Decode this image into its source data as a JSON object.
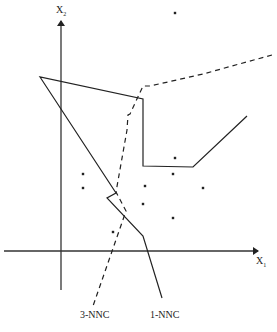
{
  "diagram": {
    "type": "nearest-neighbor decision boundaries",
    "axes": {
      "x": {
        "label": "X",
        "subscript": "1"
      },
      "y": {
        "label": "X",
        "subscript": "2"
      }
    },
    "boundaries": [
      {
        "name": "1-NNC",
        "label": "1-NNC",
        "style": "solid"
      },
      {
        "name": "3-NNC",
        "label": "3-NNC",
        "style": "dashed"
      }
    ],
    "points": [
      [
        175,
        13
      ],
      [
        145,
        186
      ],
      [
        83,
        174
      ],
      [
        83,
        188
      ],
      [
        175,
        158
      ],
      [
        173,
        174
      ],
      [
        203,
        188
      ],
      [
        143,
        204
      ],
      [
        173,
        218
      ],
      [
        113,
        232
      ]
    ],
    "colors": {
      "ink": "#222222",
      "background": "#ffffff"
    }
  }
}
